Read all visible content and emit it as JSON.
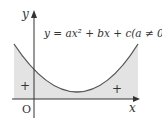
{
  "diagram": {
    "equation": "y = ax² + bx + c(a ≠ 0)",
    "axis_x_label": "x",
    "axis_y_label": "y",
    "origin_label": "O",
    "region_sign_left": "+",
    "region_sign_right": "+",
    "colors": {
      "shade": "#e3e3e3",
      "curve": "#555555",
      "axis": "#333333"
    }
  }
}
